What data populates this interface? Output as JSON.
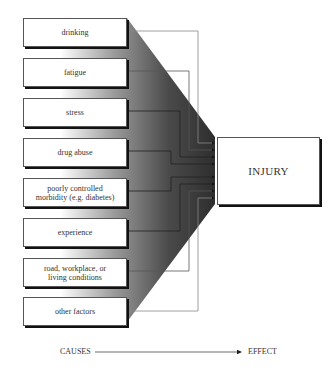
{
  "diagram": {
    "type": "cause-effect funnel",
    "causes": [
      {
        "label": "drinking"
      },
      {
        "label": "fatigue"
      },
      {
        "label": "stress"
      },
      {
        "label": "drug abuse"
      },
      {
        "label": "poorly controlled\nmorbidity (e.g. diabetes)"
      },
      {
        "label": "experience"
      },
      {
        "label": "road, workplace, or\nliving conditions"
      },
      {
        "label": "other factors"
      }
    ],
    "effect": {
      "label": "INJURY"
    },
    "axis": {
      "left_label": "CAUSES",
      "right_label": "EFFECT"
    },
    "colors": {
      "funnel_dark": "#2a2a2a",
      "funnel_light": "#ffffff",
      "line": "#666666",
      "box_border": "#555555"
    }
  }
}
